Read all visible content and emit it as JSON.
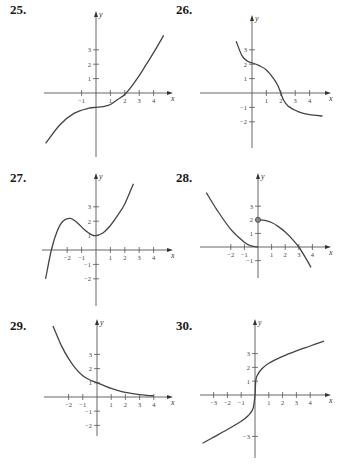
{
  "chart_data": [
    {
      "id": "25",
      "type": "line",
      "label": "25.",
      "xlabel": "x",
      "ylabel": "y",
      "x_ticks": [
        -1,
        1,
        2,
        3,
        4
      ],
      "y_ticks": [
        1,
        2,
        3
      ],
      "xlim": [
        -3.5,
        5
      ],
      "ylim": [
        -4,
        4
      ],
      "description": "Increasing cubic-like curve with flat inflection near (0,-1), crossing x-axis near x=2.2",
      "points": [
        [
          -3.5,
          -3.5
        ],
        [
          -2.5,
          -2.2
        ],
        [
          -1.5,
          -1.4
        ],
        [
          -0.5,
          -1.05
        ],
        [
          0,
          -1
        ],
        [
          0.5,
          -0.95
        ],
        [
          1,
          -0.8
        ],
        [
          1.5,
          -0.45
        ],
        [
          2,
          -0.1
        ],
        [
          2.5,
          0.5
        ],
        [
          3,
          1.2
        ],
        [
          3.5,
          2
        ],
        [
          4,
          2.8
        ],
        [
          4.7,
          4
        ]
      ]
    },
    {
      "id": "26",
      "type": "line",
      "label": "26.",
      "xlabel": "x",
      "ylabel": "y",
      "x_ticks": [
        1,
        2,
        3,
        4
      ],
      "y_ticks": [
        -2,
        -1,
        1,
        2,
        3
      ],
      "xlim": [
        -1.2,
        5
      ],
      "ylim": [
        -3.5,
        4
      ],
      "description": "Decreasing curve, plateau near y=2 around x=0, steep drop through (2,0), levels toward y=-1.6",
      "points": [
        [
          -1.1,
          3.6
        ],
        [
          -0.7,
          2.6
        ],
        [
          -0.3,
          2.2
        ],
        [
          0,
          2.1
        ],
        [
          0.5,
          1.9
        ],
        [
          1,
          1.6
        ],
        [
          1.5,
          1
        ],
        [
          1.8,
          0.5
        ],
        [
          2,
          0
        ],
        [
          2.2,
          -0.5
        ],
        [
          2.5,
          -0.9
        ],
        [
          3,
          -1.2
        ],
        [
          3.5,
          -1.4
        ],
        [
          4,
          -1.5
        ],
        [
          4.9,
          -1.6
        ]
      ]
    },
    {
      "id": "27",
      "type": "line",
      "label": "27.",
      "xlabel": "x",
      "ylabel": "y",
      "x_ticks": [
        -2,
        -1,
        1,
        2,
        3,
        4
      ],
      "y_ticks": [
        -2,
        -1,
        1,
        2,
        3
      ],
      "xlim": [
        -3.5,
        5
      ],
      "ylim": [
        -4,
        4.5
      ],
      "description": "Local max near (-1.8,2.2), local min near (0,1), rising steeply for x>0",
      "points": [
        [
          -3.5,
          -2
        ],
        [
          -3.1,
          0
        ],
        [
          -2.7,
          1.3
        ],
        [
          -2.3,
          2
        ],
        [
          -1.8,
          2.2
        ],
        [
          -1.3,
          1.9
        ],
        [
          -0.8,
          1.4
        ],
        [
          -0.3,
          1.05
        ],
        [
          0,
          1
        ],
        [
          0.5,
          1.2
        ],
        [
          1,
          1.7
        ],
        [
          1.5,
          2.4
        ],
        [
          2,
          3.2
        ],
        [
          2.6,
          4.6
        ]
      ]
    },
    {
      "id": "28",
      "type": "line",
      "label": "28.",
      "xlabel": "x",
      "ylabel": "y",
      "x_ticks": [
        -2,
        -1,
        1,
        2,
        3,
        4
      ],
      "y_ticks": [
        -1,
        1,
        2,
        3
      ],
      "xlim": [
        -3.5,
        5
      ],
      "ylim": [
        -2.5,
        4.5
      ],
      "description": "Piecewise: decreasing to (0,0) on left; open circle at (0,2) then decreasing through (3,0)",
      "segments": [
        [
          [
            -3.8,
            4
          ],
          [
            -3,
            2.7
          ],
          [
            -2,
            1.3
          ],
          [
            -1,
            0.35
          ],
          [
            -0.5,
            0.08
          ],
          [
            0,
            0
          ]
        ],
        [
          [
            0,
            2
          ],
          [
            0.5,
            1.95
          ],
          [
            1,
            1.8
          ],
          [
            1.5,
            1.5
          ],
          [
            2,
            1.1
          ],
          [
            2.5,
            0.6
          ],
          [
            3,
            0
          ],
          [
            3.5,
            -0.8
          ],
          [
            3.9,
            -1.5
          ]
        ]
      ],
      "open_point": [
        0,
        2
      ]
    },
    {
      "id": "29",
      "type": "line",
      "label": "29.",
      "xlabel": "x",
      "ylabel": "y",
      "x_ticks": [
        -2,
        -1,
        1,
        2,
        3,
        4
      ],
      "y_ticks": [
        -2,
        -1,
        1,
        2,
        3
      ],
      "xlim": [
        -3.5,
        5
      ],
      "ylim": [
        -3,
        5
      ],
      "description": "Decaying exponential-like curve through (0,1) approaching y=0",
      "points": [
        [
          -3.1,
          5
        ],
        [
          -2.5,
          3.6
        ],
        [
          -2,
          2.7
        ],
        [
          -1.5,
          2
        ],
        [
          -1,
          1.5
        ],
        [
          -0.5,
          1.2
        ],
        [
          0,
          1
        ],
        [
          0.5,
          0.8
        ],
        [
          1,
          0.6
        ],
        [
          1.5,
          0.45
        ],
        [
          2,
          0.33
        ],
        [
          2.5,
          0.24
        ],
        [
          3,
          0.17
        ],
        [
          3.5,
          0.12
        ],
        [
          4,
          0.08
        ]
      ]
    },
    {
      "id": "30",
      "type": "line",
      "label": "30.",
      "xlabel": "x",
      "ylabel": "y",
      "x_ticks": [
        -3,
        -2,
        -1,
        1,
        2,
        3,
        4
      ],
      "y_ticks": [
        -3,
        1,
        2,
        3
      ],
      "xlim": [
        -4,
        5
      ],
      "ylim": [
        -4,
        4.5
      ],
      "description": "Increasing cube-root-like curve with vertical tangent near origin, passing (0,1) and (0,-1)",
      "points": [
        [
          -3.8,
          -3.5
        ],
        [
          -3,
          -3.05
        ],
        [
          -2,
          -2.5
        ],
        [
          -1,
          -1.9
        ],
        [
          -0.5,
          -1.5
        ],
        [
          -0.15,
          -1
        ],
        [
          0,
          0
        ],
        [
          0.05,
          1
        ],
        [
          0.15,
          1.4
        ],
        [
          0.5,
          1.9
        ],
        [
          1,
          2.3
        ],
        [
          2,
          2.8
        ],
        [
          3,
          3.2
        ],
        [
          4,
          3.55
        ],
        [
          5,
          3.9
        ]
      ]
    }
  ],
  "labels": {
    "p25": "25.",
    "p26": "26.",
    "p27": "27.",
    "p28": "28.",
    "p29": "29.",
    "p30": "30.",
    "x": "x",
    "y": "y"
  }
}
